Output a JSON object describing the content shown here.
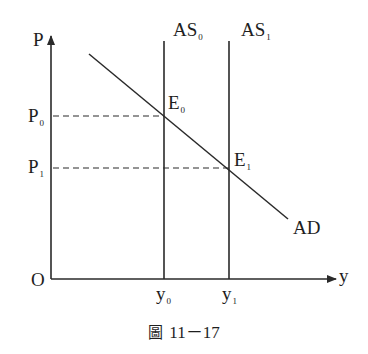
{
  "figure": {
    "caption_prefix": "圖",
    "caption_number": "11－17",
    "type": "AD-AS macroeconomic diagram"
  },
  "axes": {
    "y_axis_label": "P",
    "x_axis_label": "y",
    "origin_label": "O"
  },
  "curves": {
    "as0": {
      "label": "AS",
      "subscript": "0"
    },
    "as1": {
      "label": "AS",
      "subscript": "1"
    },
    "ad": {
      "label": "AD"
    }
  },
  "points": {
    "e0": {
      "label": "E",
      "subscript": "0"
    },
    "e1": {
      "label": "E",
      "subscript": "1"
    }
  },
  "price_levels": {
    "p0": {
      "label": "P",
      "subscript": "0"
    },
    "p1": {
      "label": "P",
      "subscript": "1"
    }
  },
  "output_levels": {
    "y0": {
      "label": "y",
      "subscript": "0"
    },
    "y1": {
      "label": "y",
      "subscript": "1"
    }
  },
  "colors": {
    "line": "#2a2a2a",
    "text": "#1e1e1e",
    "background": "#ffffff"
  }
}
